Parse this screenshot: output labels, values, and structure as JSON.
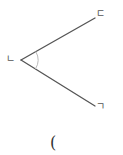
{
  "figure": {
    "type": "angle-diagram",
    "vertices": {
      "top": {
        "label": "ㄷ"
      },
      "vertex": {
        "label": "ㄴ"
      },
      "bottom": {
        "label": "ㄱ"
      }
    },
    "angle_marked_at": "ㄴ",
    "caption": "("
  },
  "colors": {
    "line": "#555555",
    "arc": "#bbbbbb",
    "label": "#555555",
    "background": "#ffffff"
  }
}
